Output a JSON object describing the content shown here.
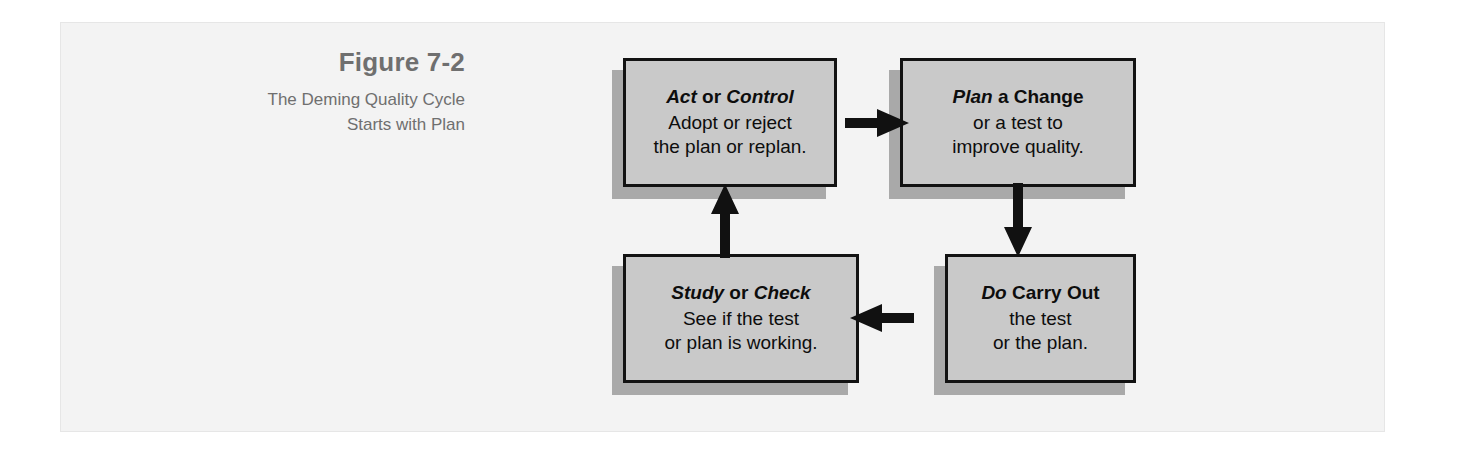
{
  "figure": {
    "caption_title": "Figure 7-2",
    "caption_line1": "The Deming Quality Cycle",
    "caption_line2": "Starts with Plan",
    "panel_background": "#f3f3f3",
    "caption_color": "#6f6f6f",
    "box_fill": "#c9c9c9",
    "box_border": "#121212",
    "box_shadow": "#a9a9a9",
    "arrow_color": "#111111"
  },
  "nodes": [
    {
      "id": "act",
      "head_emphasis_1": "Act",
      "head_plain": " or ",
      "head_emphasis_2": "Control",
      "line2": "Adopt or reject",
      "line3": "the plan or replan."
    },
    {
      "id": "plan",
      "head_emphasis_1": "Plan",
      "head_plain": " a Change",
      "head_emphasis_2": "",
      "line2": "or a test to",
      "line3": "improve quality."
    },
    {
      "id": "do",
      "head_emphasis_1": "Do",
      "head_plain": " Carry Out",
      "head_emphasis_2": "",
      "line2": "the test",
      "line3": "or the plan."
    },
    {
      "id": "study",
      "head_emphasis_1": "Study",
      "head_plain": " or ",
      "head_emphasis_2": "Check",
      "line2": "See if the test",
      "line3": "or plan is working."
    }
  ],
  "arrows": [
    {
      "id": "act-to-plan",
      "direction": "right",
      "from": "act",
      "to": "plan"
    },
    {
      "id": "plan-to-do",
      "direction": "down",
      "from": "plan",
      "to": "do"
    },
    {
      "id": "do-to-study",
      "direction": "left",
      "from": "do",
      "to": "study"
    },
    {
      "id": "study-to-act",
      "direction": "up",
      "from": "study",
      "to": "act"
    }
  ]
}
